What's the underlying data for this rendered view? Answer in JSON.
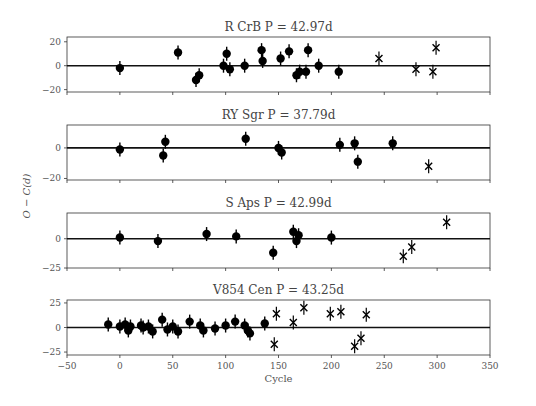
{
  "chart_data": {
    "type": "scatter",
    "xlabel": "Cycle",
    "ylabel": "O − C(d)",
    "xlim": [
      -50,
      350
    ],
    "xticks": [
      -50,
      0,
      50,
      100,
      150,
      200,
      250,
      300,
      350
    ],
    "panels": [
      {
        "title": "R CrB P = 42.97d",
        "ylim": [
          -22,
          24
        ],
        "yticks": [
          -20,
          0,
          20
        ],
        "dots": [
          [
            0,
            -2
          ],
          [
            55,
            11
          ],
          [
            72,
            -12
          ],
          [
            75,
            -8
          ],
          [
            98,
            0
          ],
          [
            101,
            10
          ],
          [
            104,
            -3
          ],
          [
            118,
            0
          ],
          [
            134,
            13
          ],
          [
            135,
            4
          ],
          [
            152,
            6
          ],
          [
            160,
            12
          ],
          [
            167,
            -8
          ],
          [
            170,
            -5
          ],
          [
            176,
            -5
          ],
          [
            178,
            13
          ],
          [
            188,
            0
          ],
          [
            207,
            -5
          ]
        ],
        "crosses": [
          [
            245,
            6
          ],
          [
            280,
            -3
          ],
          [
            296,
            -5
          ],
          [
            299,
            15
          ]
        ]
      },
      {
        "title": "RY Sgr P = 37.79d",
        "ylim": [
          -21,
          15
        ],
        "yticks": [
          -20,
          0
        ],
        "dots": [
          [
            0,
            -1
          ],
          [
            41,
            -5
          ],
          [
            43,
            4
          ],
          [
            119,
            6
          ],
          [
            150,
            0
          ],
          [
            153,
            -3
          ],
          [
            208,
            2
          ],
          [
            222,
            3
          ],
          [
            225,
            -9
          ],
          [
            258,
            3
          ]
        ],
        "crosses": [
          [
            292,
            -12
          ]
        ]
      },
      {
        "title": "S Aps P = 42.99d",
        "ylim": [
          -25,
          22
        ],
        "yticks": [
          -25,
          0
        ],
        "dots": [
          [
            0,
            1
          ],
          [
            36,
            -2
          ],
          [
            82,
            4
          ],
          [
            110,
            2
          ],
          [
            145,
            -12
          ],
          [
            164,
            6
          ],
          [
            167,
            -2
          ],
          [
            169,
            3
          ],
          [
            200,
            1
          ]
        ],
        "crosses": [
          [
            268,
            -15
          ],
          [
            276,
            -7
          ],
          [
            309,
            14
          ]
        ]
      },
      {
        "title": "V854 Cen P = 43.25d",
        "ylim": [
          -28,
          28
        ],
        "yticks": [
          -25,
          0,
          25
        ],
        "dots": [
          [
            -11,
            3
          ],
          [
            0,
            1
          ],
          [
            5,
            3
          ],
          [
            8,
            -3
          ],
          [
            10,
            1
          ],
          [
            20,
            2
          ],
          [
            22,
            0
          ],
          [
            27,
            1
          ],
          [
            31,
            -4
          ],
          [
            40,
            8
          ],
          [
            45,
            -2
          ],
          [
            50,
            1
          ],
          [
            55,
            -4
          ],
          [
            66,
            6
          ],
          [
            76,
            2
          ],
          [
            79,
            -3
          ],
          [
            90,
            -1
          ],
          [
            100,
            2
          ],
          [
            109,
            6
          ],
          [
            118,
            2
          ],
          [
            121,
            -3
          ],
          [
            123,
            -6
          ],
          [
            137,
            4
          ]
        ],
        "crosses": [
          [
            146,
            -17
          ],
          [
            148,
            14
          ],
          [
            164,
            5
          ],
          [
            174,
            20
          ],
          [
            199,
            14
          ],
          [
            209,
            16
          ],
          [
            222,
            -19
          ],
          [
            228,
            -11
          ],
          [
            233,
            13
          ]
        ]
      }
    ]
  }
}
